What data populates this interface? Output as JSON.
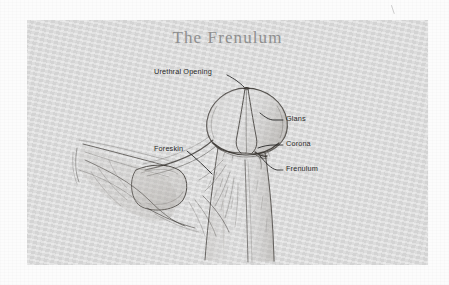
{
  "page": {
    "background_color": "#fcfcfc",
    "width": 449,
    "height": 285
  },
  "figure": {
    "panel_color": "#d9d9d9",
    "title": "The Frenulum",
    "title_color": "#8f8f8f",
    "medium": "pencil line drawing",
    "labels": [
      {
        "id": "urethral-opening",
        "text": "Urethral Opening",
        "side": "top",
        "text_x": 127,
        "text_y": 51,
        "leader_from_x": 201,
        "leader_from_y": 54,
        "leader_to_x": 216,
        "leader_to_y": 67
      },
      {
        "id": "glans",
        "text": "Glans",
        "side": "right",
        "text_x": 258,
        "text_y": 98,
        "leader_from_x": 254,
        "leader_from_y": 101,
        "leader_to_x": 232,
        "leader_to_y": 94
      },
      {
        "id": "corona",
        "text": "Corona",
        "side": "right",
        "text_x": 258,
        "text_y": 123,
        "leader_from_x": 254,
        "leader_from_y": 126,
        "leader_to_x": 230,
        "leader_to_y": 128
      },
      {
        "id": "frenulum",
        "text": "Frenulum",
        "side": "right",
        "text_x": 258,
        "text_y": 148,
        "leader_from_x": 254,
        "leader_from_y": 150,
        "leader_to_x": 233,
        "leader_to_y": 135
      },
      {
        "id": "foreskin",
        "text": "Foreskin",
        "side": "left",
        "text_x": 127,
        "text_y": 128,
        "leader_from_x": 163,
        "leader_from_y": 132,
        "leader_to_x": 183,
        "leader_to_y": 152
      }
    ],
    "line_color": "#3a3632",
    "label_text_color": "#2a2a2a"
  }
}
